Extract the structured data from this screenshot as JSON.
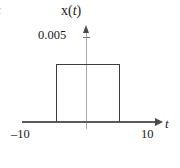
{
  "figure": {
    "edge_label": "c",
    "function_label_base": "x",
    "function_label_open": "(",
    "function_label_var": "t",
    "function_label_close": ")",
    "amplitude_label": "0.005",
    "x_min_label": "–10",
    "x_max_label": "10",
    "x_axis_label": "t",
    "line_color": "#3d3d3d",
    "axis_color": "#5a5a5a",
    "v_axis_color": "#a9a9a9"
  },
  "chart_data": {
    "type": "line",
    "title": "x(t)",
    "xlabel": "t",
    "ylabel": "x(t)",
    "xlim": [
      -10,
      10
    ],
    "ylim": [
      0,
      0.005
    ],
    "grid": false,
    "legend": null,
    "xticks": [
      -10,
      10
    ],
    "xticklabels": [
      "–10",
      "10"
    ],
    "yticks": [
      0.005
    ],
    "yticklabels": [
      "0.005"
    ],
    "series": [
      {
        "name": "x(t)",
        "x": [
          -10,
          -5,
          -5,
          5,
          5,
          10
        ],
        "values": [
          0,
          0,
          0.005,
          0.005,
          0,
          0
        ]
      }
    ],
    "annotations": [
      {
        "text": "0.005",
        "x": 0,
        "y": 0.005,
        "role": "amplitude-tick-label"
      },
      {
        "text": "–10",
        "x": -10,
        "y": 0,
        "role": "x-axis-min-label"
      },
      {
        "text": "10",
        "x": 10,
        "y": 0,
        "role": "x-axis-max-label"
      }
    ]
  }
}
